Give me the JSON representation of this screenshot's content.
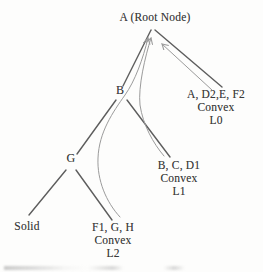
{
  "figure": {
    "background": "#fdfdfc",
    "colors": {
      "edge": "#4b4b4b",
      "arrow": "#9b9b9b",
      "text": "#3a3a3a"
    },
    "root": {
      "label": "A (Root Node)"
    },
    "nodes": {
      "b": "B",
      "g": "G"
    },
    "leaves": {
      "solid": {
        "label": "Solid"
      },
      "hull_l2": {
        "members": "F1, G, H",
        "type": "Convex",
        "level": "L2"
      },
      "hull_l1": {
        "members": "B, C, D1",
        "type": "Convex",
        "level": "L1"
      },
      "hull_l0": {
        "members": "A, D2,E, F2",
        "type": "Convex",
        "level": "L0"
      }
    }
  }
}
